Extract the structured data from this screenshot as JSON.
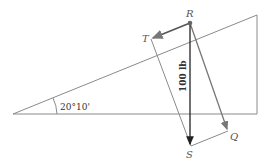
{
  "diagram": {
    "angle_label": "20°10'",
    "force_label": "100 lb",
    "points": {
      "R": "R",
      "T": "T",
      "S": "S",
      "Q": "Q"
    },
    "colors": {
      "structure": "#8a8a8a",
      "force_arrow": "#222222",
      "component_arrow": "#6b6b6b"
    }
  }
}
